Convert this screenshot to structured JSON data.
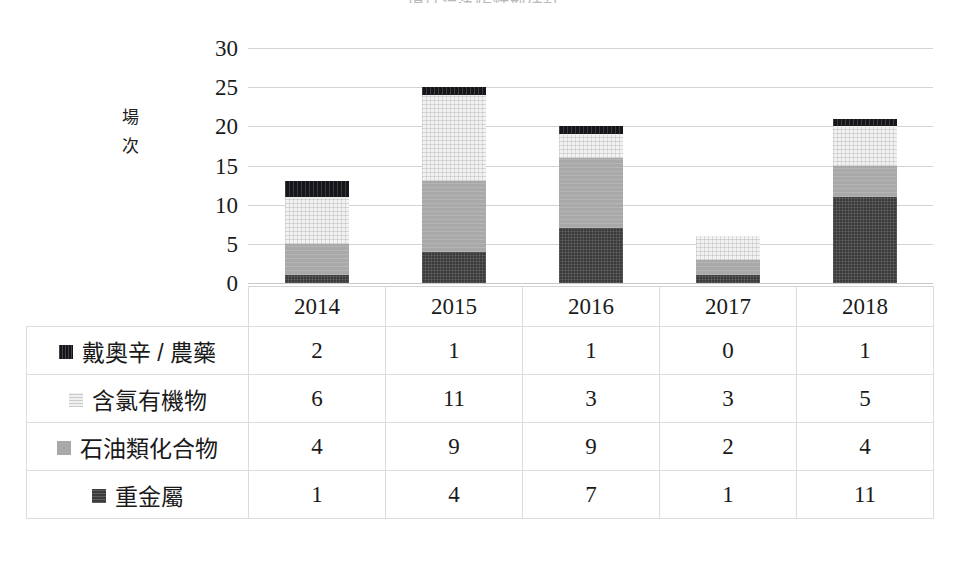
{
  "title_sliver": "場址污染物類型統計",
  "chart_data": {
    "type": "bar",
    "stacked": true,
    "title": "",
    "xlabel": "",
    "ylabel": "場次",
    "ylim": [
      0,
      30
    ],
    "yticks": [
      30,
      25,
      20,
      15,
      10,
      5,
      0
    ],
    "grid": true,
    "legend_position": "table-left",
    "categories": [
      "2014",
      "2015",
      "2016",
      "2017",
      "2018"
    ],
    "series": [
      {
        "name": "重金屬",
        "key": "heavy",
        "color": "#3b3b3b",
        "values": [
          1,
          4,
          7,
          1,
          11
        ]
      },
      {
        "name": "石油類化合物",
        "key": "petro",
        "color": "#a9a9a9",
        "values": [
          4,
          9,
          9,
          2,
          4
        ]
      },
      {
        "name": "含氯有機物",
        "key": "chloro",
        "color": "#f2f2f2",
        "values": [
          6,
          11,
          3,
          3,
          5
        ]
      },
      {
        "name": "戴奧辛 / 農藥",
        "key": "dioxin",
        "color": "#15151a",
        "values": [
          2,
          1,
          1,
          0,
          1
        ]
      }
    ],
    "stack_order_bottom_to_top": [
      "heavy",
      "petro",
      "chloro",
      "dioxin"
    ],
    "totals": [
      13,
      25,
      20,
      6,
      21
    ]
  },
  "table": {
    "header": [
      "",
      "2014",
      "2015",
      "2016",
      "2017",
      "2018"
    ],
    "rows": [
      {
        "label": "戴奧辛 / 農藥",
        "key": "dioxin",
        "values": [
          "2",
          "1",
          "1",
          "0",
          "1"
        ]
      },
      {
        "label": "含氯有機物",
        "key": "chloro",
        "values": [
          "6",
          "11",
          "3",
          "3",
          "5"
        ]
      },
      {
        "label": "石油類化合物",
        "key": "petro",
        "values": [
          "4",
          "9",
          "9",
          "2",
          "4"
        ]
      },
      {
        "label": "重金屬",
        "key": "heavy",
        "values": [
          "1",
          "4",
          "7",
          "1",
          "11"
        ]
      }
    ]
  }
}
